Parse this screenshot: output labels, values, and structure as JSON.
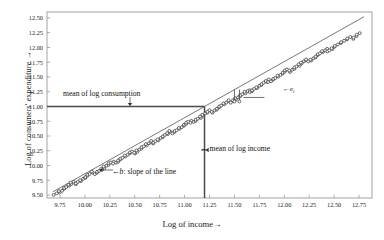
{
  "chart_data": {
    "type": "scatter",
    "title": "",
    "xlabel": "Log of income→",
    "ylabel": "Log of consumers' expenditure →",
    "xlim": [
      9.62,
      12.88
    ],
    "ylim": [
      9.45,
      12.6
    ],
    "grid": false,
    "legend": null,
    "xticks": [
      "9.75",
      "10.00",
      "10.25",
      "10.50",
      "10.75",
      "11.00",
      "11.25",
      "11.50",
      "11.75",
      "12.00",
      "12.25",
      "12.50",
      "12.75"
    ],
    "xtick_values": [
      9.75,
      10.0,
      10.25,
      10.5,
      10.75,
      11.0,
      11.25,
      11.5,
      11.75,
      12.0,
      12.25,
      12.5,
      12.75
    ],
    "yticks": [
      "9.50",
      "9.75",
      "10.00",
      "10.25",
      "10.50",
      "10.75",
      "11.00",
      "11.25",
      "11.50",
      "11.75",
      "12.00",
      "12.25",
      "12.50"
    ],
    "ytick_values": [
      9.5,
      9.75,
      10.0,
      10.25,
      10.5,
      10.75,
      11.0,
      11.25,
      11.5,
      11.75,
      12.0,
      12.25,
      12.5
    ],
    "mean_log_income": 11.2,
    "mean_log_consumption": 11.0,
    "regression_line": {
      "intercept": 0.36,
      "slope": 0.95,
      "x_start": 9.68,
      "x_end": 12.8
    },
    "series": [
      {
        "name": "observations",
        "marker": "open-circle",
        "x": [
          9.7,
          9.72,
          9.74,
          9.75,
          9.77,
          9.78,
          9.8,
          9.81,
          9.83,
          9.84,
          9.86,
          9.87,
          9.89,
          9.9,
          9.92,
          9.93,
          9.95,
          9.96,
          9.98,
          9.99,
          10.01,
          10.02,
          10.04,
          10.05,
          10.07,
          10.08,
          10.1,
          10.11,
          10.13,
          10.14,
          10.16,
          10.17,
          10.19,
          10.2,
          10.22,
          10.23,
          10.25,
          10.26,
          10.28,
          10.29,
          10.31,
          10.32,
          10.34,
          10.35,
          10.37,
          10.38,
          10.4,
          10.41,
          10.43,
          10.44,
          10.46,
          10.47,
          10.49,
          10.5,
          10.52,
          10.53,
          10.55,
          10.56,
          10.58,
          10.59,
          10.61,
          10.62,
          10.64,
          10.65,
          10.67,
          10.68,
          10.7,
          10.71,
          10.73,
          10.74,
          10.76,
          10.77,
          10.79,
          10.8,
          10.82,
          10.83,
          10.85,
          10.86,
          10.88,
          10.89,
          10.91,
          10.92,
          10.94,
          10.95,
          10.97,
          10.98,
          11.0,
          11.01,
          11.03,
          11.04,
          11.06,
          11.07,
          11.09,
          11.1,
          11.12,
          11.13,
          11.15,
          11.16,
          11.18,
          11.19,
          11.21,
          11.22,
          11.24,
          11.25,
          11.27,
          11.28,
          11.3,
          11.31,
          11.33,
          11.34,
          11.36,
          11.37,
          11.39,
          11.4,
          11.42,
          11.43,
          11.45,
          11.46,
          11.48,
          11.49,
          11.51,
          11.52,
          11.54,
          11.55,
          11.57,
          11.58,
          11.6,
          11.61,
          11.63,
          11.64,
          11.66,
          11.67,
          11.69,
          11.7,
          11.72,
          11.73,
          11.75,
          11.76,
          11.78,
          11.79,
          11.81,
          11.82,
          11.84,
          11.85,
          11.87,
          11.88,
          11.9,
          11.91,
          11.93,
          11.94,
          11.96,
          11.97,
          11.99,
          12.0,
          12.02,
          12.03,
          12.05,
          12.06,
          12.08,
          12.09,
          12.11,
          12.12,
          12.14,
          12.15,
          12.17,
          12.18,
          12.2,
          12.21,
          12.23,
          12.24,
          12.26,
          12.27,
          12.29,
          12.3,
          12.32,
          12.33,
          12.35,
          12.36,
          12.38,
          12.39,
          12.41,
          12.42,
          12.44,
          12.45,
          12.47,
          12.48,
          12.5,
          12.52,
          12.54,
          12.56,
          12.58,
          12.6,
          12.62,
          12.64,
          12.66,
          12.68,
          12.7,
          12.72,
          12.74,
          12.76
        ],
        "y": [
          9.53,
          9.55,
          9.56,
          9.58,
          9.58,
          9.61,
          9.62,
          9.63,
          9.65,
          9.66,
          9.67,
          9.69,
          9.7,
          9.71,
          9.72,
          9.74,
          9.75,
          9.76,
          9.78,
          9.79,
          9.8,
          9.82,
          9.83,
          9.84,
          9.86,
          9.87,
          9.88,
          9.9,
          9.91,
          9.92,
          9.94,
          9.95,
          9.96,
          9.98,
          9.99,
          10.0,
          10.02,
          10.03,
          10.04,
          10.06,
          10.07,
          10.08,
          10.1,
          10.11,
          10.12,
          10.13,
          10.15,
          10.16,
          10.17,
          10.19,
          10.2,
          10.21,
          10.23,
          10.24,
          10.25,
          10.27,
          10.28,
          10.29,
          10.31,
          10.32,
          10.33,
          10.35,
          10.36,
          10.37,
          10.39,
          10.4,
          10.41,
          10.43,
          10.44,
          10.45,
          10.47,
          10.48,
          10.49,
          10.51,
          10.52,
          10.53,
          10.55,
          10.56,
          10.57,
          10.59,
          10.6,
          10.61,
          10.63,
          10.64,
          10.65,
          10.67,
          10.68,
          10.69,
          10.71,
          10.72,
          10.73,
          10.75,
          10.76,
          10.77,
          10.79,
          10.8,
          10.81,
          10.83,
          10.84,
          10.85,
          10.87,
          10.88,
          10.89,
          10.91,
          10.92,
          10.93,
          10.95,
          10.96,
          10.97,
          10.99,
          11.0,
          11.01,
          11.03,
          11.04,
          11.05,
          11.07,
          11.08,
          11.09,
          11.11,
          11.12,
          11.13,
          11.15,
          11.16,
          11.17,
          11.19,
          11.2,
          11.21,
          11.23,
          11.24,
          11.25,
          11.27,
          11.28,
          11.29,
          11.31,
          11.32,
          11.33,
          11.35,
          11.36,
          11.37,
          11.39,
          11.4,
          11.41,
          11.43,
          11.44,
          11.45,
          11.47,
          11.48,
          11.49,
          11.51,
          11.52,
          11.53,
          11.55,
          11.56,
          11.57,
          11.59,
          11.6,
          11.61,
          11.63,
          11.64,
          11.65,
          11.67,
          11.68,
          11.69,
          11.71,
          11.72,
          11.73,
          11.75,
          11.76,
          11.77,
          11.79,
          11.8,
          11.81,
          11.83,
          11.84,
          11.85,
          11.87,
          11.88,
          11.89,
          11.91,
          11.92,
          11.93,
          11.95,
          11.96,
          11.97,
          11.99,
          12.0,
          12.02,
          12.03,
          12.05,
          12.07,
          12.08,
          12.1,
          12.12,
          12.13,
          12.15,
          12.17,
          12.19,
          12.21,
          12.23,
          12.25
        ]
      }
    ],
    "annotations": [
      {
        "id": "mean-consumption",
        "text": "mean of log consumption",
        "arrow": "down",
        "x": 11.0,
        "y": 11.0
      },
      {
        "id": "mean-income",
        "text": "← mean of log income",
        "arrow": "left",
        "x": 11.2,
        "y": 10.05
      },
      {
        "id": "slope",
        "text": "←b: slope of the line",
        "arrow": "left",
        "x": 10.35,
        "y": 9.82
      },
      {
        "id": "residual",
        "text": "←e",
        "sub": "i",
        "arrow": "left",
        "x": 11.62,
        "y": 11.33
      }
    ]
  },
  "axis": {
    "x_label": "Log of income→",
    "y_label": "Log of consumers' expenditure →"
  },
  "annotations": {
    "mean_consumption": "mean of log consumption",
    "mean_income": "← mean of log income",
    "slope_prefix": "←",
    "slope_symbol": "b",
    "slope_suffix": ": slope of the line",
    "residual_prefix": "←",
    "residual_symbol": "e",
    "residual_subscript": "i"
  },
  "colors": {
    "frame": "#9a9a9a",
    "marker_edge": "#3a3a3a",
    "marker_fill": "#ffffff",
    "mean_line": "#4a4a4a",
    "annotation_line": "#333333",
    "background": "#ffffff"
  }
}
